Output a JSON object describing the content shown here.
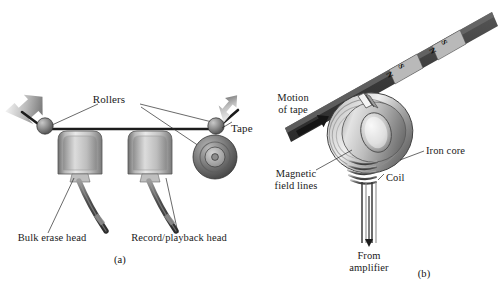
{
  "figure": {
    "background_color": "#ffffff",
    "ink_color": "#1a1a1a",
    "tape_color": "#3b3b3b",
    "metal_light": "#e6e6e6",
    "metal_mid": "#9a9a9a",
    "metal_dark": "#4a4a4a"
  },
  "panel_a": {
    "tag": "(a)",
    "labels": {
      "rollers": "Rollers",
      "tape": "Tape",
      "bulk_erase_head": "Bulk erase head",
      "record_playback_head": "Record/playback head"
    },
    "components": {
      "roller_left": "roller",
      "roller_right": "roller",
      "reel": "supply-reel",
      "head_left": "bulk-erase-head",
      "head_right": "record-playback-head",
      "arrow_in": "tape-in-arrow",
      "arrow_out": "tape-out-arrow"
    }
  },
  "panel_b": {
    "tag": "(b)",
    "labels": {
      "motion_of_tape_line1": "Motion",
      "motion_of_tape_line2": "of tape",
      "magnetic_field_lines_line1": "Magnetic",
      "magnetic_field_lines_line2": "field lines",
      "iron_core": "Iron core",
      "coil": "Coil",
      "from_amplifier_line1": "From",
      "from_amplifier_line2": "amplifier"
    },
    "tape_domains": [
      {
        "north": "N",
        "south": "S"
      },
      {
        "north": "N",
        "south": "S"
      }
    ],
    "components": {
      "tape": "magnetic-tape",
      "iron_core": "iron-core-toroid",
      "core_gap": "core-gap",
      "coil": "coil-windings",
      "leads": "amplifier-leads",
      "motion_arrow": "tape-motion-arrow",
      "current_arrow": "current-direction-arrow"
    }
  }
}
